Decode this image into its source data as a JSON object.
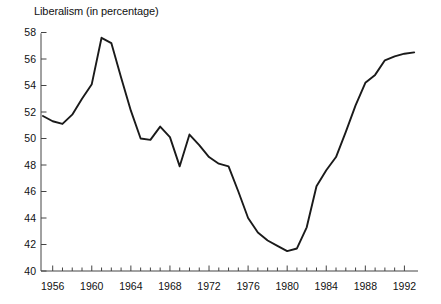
{
  "chart_data": {
    "type": "line",
    "title": "Liberalism (in percentage)",
    "subtitle": "",
    "xlabel": "",
    "ylabel": "",
    "xlim": [
      1955,
      1993
    ],
    "ylim": [
      40,
      58
    ],
    "y_ticks": [
      40,
      42,
      44,
      46,
      48,
      50,
      52,
      54,
      56,
      58
    ],
    "y_tick_labels": [
      "40",
      "42",
      "44",
      "46",
      "48",
      "50",
      "52",
      "54",
      "56",
      "58"
    ],
    "x_ticks": [
      1956,
      1960,
      1964,
      1968,
      1972,
      1976,
      1980,
      1984,
      1988,
      1992
    ],
    "x_tick_labels": [
      "1956",
      "1960",
      "1964",
      "1968",
      "1972",
      "1976",
      "1980",
      "1984",
      "1988",
      "1992"
    ],
    "x_minor_tick_interval": 1,
    "grid": false,
    "legend": false,
    "legend_position": "none",
    "line_color": "#1a1a1a",
    "line_width": 1.9,
    "x": [
      1955,
      1956,
      1957,
      1958,
      1959,
      1960,
      1961,
      1962,
      1963,
      1964,
      1965,
      1966,
      1967,
      1968,
      1969,
      1970,
      1971,
      1972,
      1973,
      1974,
      1975,
      1976,
      1977,
      1978,
      1979,
      1980,
      1981,
      1982,
      1983,
      1984,
      1985,
      1986,
      1987,
      1988,
      1989,
      1990,
      1991,
      1992,
      1993
    ],
    "values": [
      51.7,
      51.3,
      51.1,
      51.8,
      53.0,
      54.1,
      57.6,
      57.2,
      54.6,
      52.1,
      50.0,
      49.9,
      50.9,
      50.1,
      47.9,
      50.3,
      49.5,
      48.6,
      48.1,
      47.9,
      46.0,
      44.0,
      42.9,
      42.3,
      41.9,
      41.5,
      41.7,
      43.3,
      46.4,
      47.6,
      48.6,
      50.5,
      52.5,
      54.2,
      54.8,
      55.9,
      56.2,
      56.4,
      56.5
    ],
    "series": [
      {
        "name": "Liberalism",
        "values": [
          51.7,
          51.3,
          51.1,
          51.8,
          53.0,
          54.1,
          57.6,
          57.2,
          54.6,
          52.1,
          50.0,
          49.9,
          50.9,
          50.1,
          47.9,
          50.3,
          49.5,
          48.6,
          48.1,
          47.9,
          46.0,
          44.0,
          42.9,
          42.3,
          41.9,
          41.5,
          41.7,
          43.3,
          46.4,
          47.6,
          48.6,
          50.5,
          52.5,
          54.2,
          54.8,
          55.9,
          56.2,
          56.4,
          56.5
        ]
      }
    ],
    "annotations": []
  },
  "axes": {
    "y_axis_name": "liberalism-percentage-axis",
    "x_axis_name": "year-axis"
  }
}
